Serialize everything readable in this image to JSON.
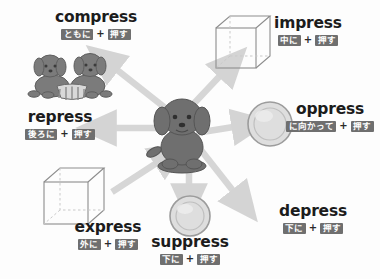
{
  "diagram": {
    "title_word_root": "press",
    "center": {
      "name": "puppy",
      "label": "center-puppy"
    },
    "background_color": "#fdfdfd",
    "arrow_color": "#d6d6d6",
    "chip_color": "#6f6f6f",
    "word_color": "#1c1c1c",
    "plus_symbol": "+",
    "entries": [
      {
        "id": "compress",
        "word": "compress",
        "prefix_gloss": "ともに",
        "root_gloss": "押す",
        "illustration": "two-puppies-squeezed",
        "direction": "up-left"
      },
      {
        "id": "impress",
        "word": "impress",
        "prefix_gloss": "中に",
        "root_gloss": "押す",
        "illustration": "cube-inward",
        "direction": "up-right"
      },
      {
        "id": "oppress",
        "word": "oppress",
        "prefix_gloss": "に向かって",
        "root_gloss": "押す",
        "illustration": "round-shield-disc",
        "direction": "right"
      },
      {
        "id": "depress",
        "word": "depress",
        "prefix_gloss": "下に",
        "root_gloss": "押す",
        "illustration": "arrow-only",
        "direction": "down-right"
      },
      {
        "id": "suppress",
        "word": "suppress",
        "prefix_gloss": "下に",
        "root_gloss": "押す",
        "illustration": "round-disc-below",
        "direction": "down"
      },
      {
        "id": "express",
        "word": "express",
        "prefix_gloss": "外に",
        "root_gloss": "押す",
        "illustration": "cube-outward",
        "direction": "down-left"
      },
      {
        "id": "repress",
        "word": "repress",
        "prefix_gloss": "後ろに",
        "root_gloss": "押す",
        "illustration": "arrow-only",
        "direction": "left"
      }
    ]
  }
}
